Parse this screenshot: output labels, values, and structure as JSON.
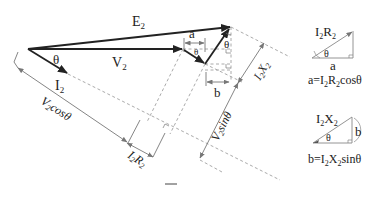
{
  "diagram": {
    "phasors": {
      "E2": {
        "label": "E",
        "sub": "2"
      },
      "V2": {
        "label": "V",
        "sub": "2"
      },
      "I2": {
        "label": "I",
        "sub": "2"
      }
    },
    "angles": {
      "theta_main": "θ",
      "theta_top": "θ",
      "theta_small": "θ"
    },
    "segments": {
      "a": "a",
      "b": "b",
      "V2cos": {
        "pre": "V",
        "sub": "2",
        "post": "cosθ"
      },
      "V2sin": {
        "pre": "V",
        "sub": "2",
        "post": "sinθ"
      },
      "I2R2": {
        "a": "I",
        "s1": "2",
        "b": "R",
        "s2": "2"
      },
      "I2X2": {
        "a": "I",
        "s1": "2",
        "b": "X",
        "s2": "2"
      }
    },
    "inset_top": {
      "hyp": {
        "a": "I",
        "s1": "2",
        "b": "R",
        "s2": "2"
      },
      "theta": "θ",
      "base": "a",
      "formula": {
        "lhs": "a=I",
        "s1": "2",
        "mid": "R",
        "s2": "2",
        "rhs": "cosθ"
      }
    },
    "inset_bottom": {
      "hyp": {
        "a": "I",
        "s1": "2",
        "b": "X",
        "s2": "2"
      },
      "theta": "θ",
      "side": "b",
      "formula": {
        "lhs": "b=I",
        "s1": "2",
        "mid": "X",
        "s2": "2",
        "rhs": "sinθ"
      }
    },
    "colors": {
      "main_vector": "#222222",
      "construction": "#999999",
      "dim_line": "#777777"
    }
  }
}
